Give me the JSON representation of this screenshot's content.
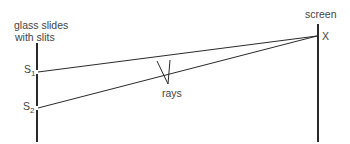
{
  "diagram": {
    "labels": {
      "slides_line1": "glass slides",
      "slides_line2": "with slits",
      "s1_main": "S",
      "s1_sub": "1",
      "s2_main": "S",
      "s2_sub": "2",
      "screen": "screen",
      "x_point": "X",
      "rays": "rays"
    },
    "colors": {
      "line": "#2a2a2a",
      "text": "#444444",
      "background": "#ffffff"
    }
  }
}
